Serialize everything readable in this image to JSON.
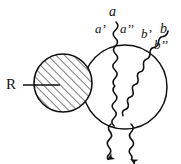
{
  "figure": {
    "background_color": "#ffffff",
    "ink_color": "#111111",
    "labels": {
      "region": "R",
      "a": "a",
      "a_prime": "a’",
      "a_double_prime": "a’’",
      "b_prime": "b’",
      "b": "b",
      "b_double_prime": "b’’"
    },
    "shapes": {
      "hatched_blob": {
        "name": "hatched-region-circle",
        "cx": 63,
        "cy": 83,
        "r": 29,
        "hatch_angle_deg": 45,
        "hatch_spacing_px": 6,
        "hatch_color": "#222222",
        "fill": "#ffffff"
      },
      "open_blob": {
        "name": "open-interaction-circle",
        "cx": 125,
        "cy": 87,
        "r": 42,
        "fill": "#ffffff",
        "stroke": "#111111"
      },
      "leader_line": {
        "name": "region-leader-line",
        "x1": 23,
        "y1": 85,
        "x2": 58,
        "y2": 85
      }
    },
    "wavy_lines": [
      {
        "name": "photon-a",
        "from": "a",
        "direction": "incoming-top"
      },
      {
        "name": "photon-b",
        "from": "b",
        "direction": "incoming-upper-right"
      },
      {
        "name": "photon-out-left",
        "direction": "outgoing-bottom-left",
        "arrow": true
      },
      {
        "name": "photon-out-right",
        "direction": "outgoing-bottom-right",
        "arrow": true
      }
    ]
  }
}
